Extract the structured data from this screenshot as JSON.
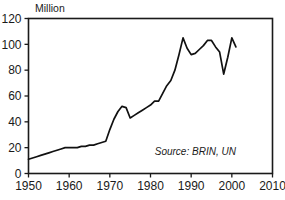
{
  "chart_data": {
    "type": "line",
    "title": "",
    "subtitle": "",
    "xlabel": "",
    "ylabel": "Million",
    "ylabel_position": "above-axis-top-left",
    "xlim": [
      1950,
      2010
    ],
    "ylim": [
      0,
      120
    ],
    "y_ticks": [
      0,
      20,
      40,
      60,
      80,
      100,
      120
    ],
    "x_ticks": [
      1950,
      1960,
      1970,
      1980,
      1990,
      2000,
      2010
    ],
    "y_tick_labels": [
      "0",
      "20",
      "40",
      "60",
      "80",
      "100",
      "120"
    ],
    "x_tick_labels": [
      "1950",
      "1960",
      "1970",
      "1980",
      "1990",
      "2000",
      "2010"
    ],
    "grid": false,
    "legend": null,
    "legend_position": "none",
    "annotations": [
      {
        "name": "source-note",
        "text": "Source: BRIN, UN",
        "style": "italic",
        "x": 2001,
        "y": 14
      }
    ],
    "series": [
      {
        "name": "Value",
        "color": "#111111",
        "x": [
          1950,
          1951,
          1952,
          1953,
          1954,
          1955,
          1956,
          1957,
          1958,
          1959,
          1960,
          1961,
          1962,
          1963,
          1964,
          1965,
          1966,
          1967,
          1968,
          1969,
          1970,
          1971,
          1972,
          1973,
          1974,
          1975,
          1976,
          1977,
          1978,
          1979,
          1980,
          1981,
          1982,
          1983,
          1984,
          1985,
          1986,
          1987,
          1988,
          1989,
          1990,
          1991,
          1992,
          1993,
          1994,
          1995,
          1996,
          1997,
          1998,
          1999,
          2000,
          2001
        ],
        "values": [
          11,
          12,
          13,
          14,
          15,
          16,
          17,
          18,
          19,
          20,
          20,
          20,
          20,
          21,
          21,
          22,
          22,
          23,
          24,
          25,
          34,
          42,
          48,
          52,
          51,
          43,
          45,
          47,
          49,
          51,
          53,
          56,
          56,
          62,
          68,
          72,
          80,
          92,
          105,
          97,
          92,
          93,
          96,
          99,
          103,
          103,
          98,
          94,
          77,
          90,
          105,
          98
        ]
      }
    ]
  },
  "axis": {
    "y_title": "Million"
  }
}
